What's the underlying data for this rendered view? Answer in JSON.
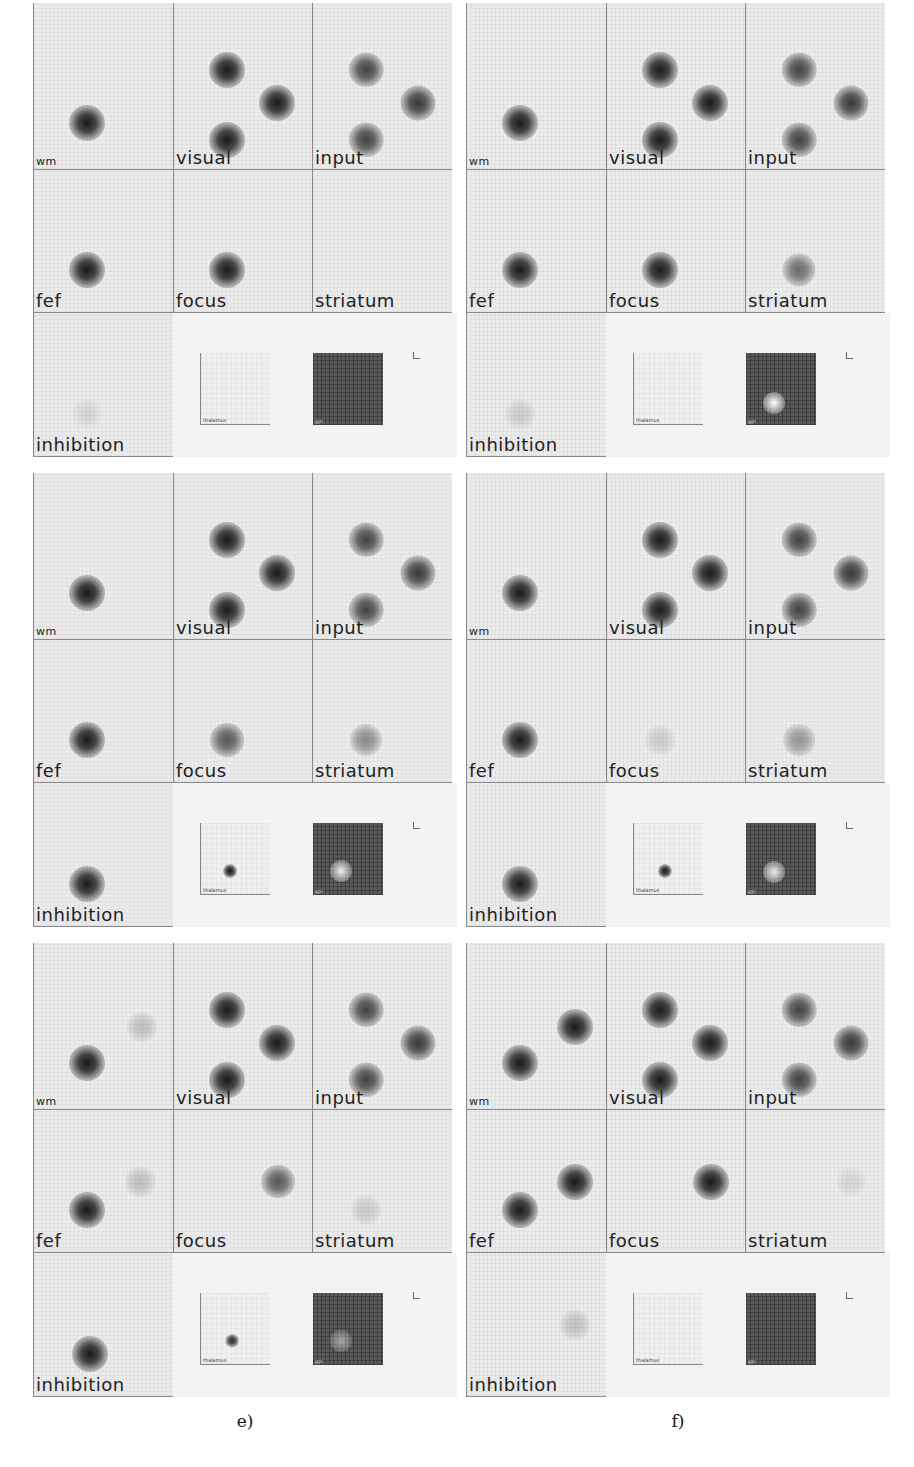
{
  "figure": {
    "panels": [
      {
        "id": "a",
        "caption": "a)",
        "cells": {
          "wm": {
            "label": "wm",
            "blobs": [
              {
                "x": 0.38,
                "y": 0.72,
                "i": 1.0
              }
            ]
          },
          "visual": {
            "label": "visual",
            "blobs": [
              {
                "x": 0.38,
                "y": 0.4,
                "i": 1.0
              },
              {
                "x": 0.74,
                "y": 0.6,
                "i": 1.0
              },
              {
                "x": 0.38,
                "y": 0.82,
                "i": 1.0
              }
            ]
          },
          "input": {
            "label": "input",
            "blobs": [
              {
                "x": 0.38,
                "y": 0.4,
                "i": 0.8
              },
              {
                "x": 0.75,
                "y": 0.6,
                "i": 0.85
              },
              {
                "x": 0.38,
                "y": 0.82,
                "i": 0.8
              }
            ]
          },
          "fef": {
            "label": "fef",
            "blobs": [
              {
                "x": 0.38,
                "y": 0.7,
                "i": 1.0
              }
            ]
          },
          "focus": {
            "label": "focus",
            "blobs": [
              {
                "x": 0.38,
                "y": 0.7,
                "i": 1.0
              }
            ]
          },
          "striatum": {
            "label": "striatum",
            "blobs": []
          },
          "inhibition": {
            "label": "inhibition",
            "blobs": [
              {
                "x": 0.38,
                "y": 0.7,
                "i": 0.1
              }
            ]
          }
        },
        "thalamus": {
          "label": "thalamus",
          "blob": null
        },
        "gpi": {
          "label": "gpi",
          "hole": null
        }
      },
      {
        "id": "b",
        "caption": "b)",
        "cells": {
          "wm": {
            "label": "wm",
            "blobs": [
              {
                "x": 0.38,
                "y": 0.72,
                "i": 1.0
              }
            ]
          },
          "visual": {
            "label": "visual",
            "blobs": [
              {
                "x": 0.38,
                "y": 0.4,
                "i": 1.0
              },
              {
                "x": 0.74,
                "y": 0.6,
                "i": 1.0
              },
              {
                "x": 0.38,
                "y": 0.82,
                "i": 1.0
              }
            ]
          },
          "input": {
            "label": "input",
            "blobs": [
              {
                "x": 0.38,
                "y": 0.4,
                "i": 0.8
              },
              {
                "x": 0.75,
                "y": 0.6,
                "i": 0.85
              },
              {
                "x": 0.38,
                "y": 0.82,
                "i": 0.8
              }
            ]
          },
          "fef": {
            "label": "fef",
            "blobs": [
              {
                "x": 0.38,
                "y": 0.7,
                "i": 1.0
              }
            ]
          },
          "focus": {
            "label": "focus",
            "blobs": [
              {
                "x": 0.38,
                "y": 0.7,
                "i": 1.0
              }
            ]
          },
          "striatum": {
            "label": "striatum",
            "blobs": [
              {
                "x": 0.38,
                "y": 0.7,
                "i": 0.6
              }
            ]
          },
          "inhibition": {
            "label": "inhibition",
            "blobs": [
              {
                "x": 0.38,
                "y": 0.7,
                "i": 0.15
              }
            ]
          }
        },
        "thalamus": {
          "label": "thalamus",
          "blob": null
        },
        "gpi": {
          "label": "gpi",
          "hole": {
            "x": 0.4,
            "y": 0.7,
            "i": 1.0
          }
        }
      },
      {
        "id": "c",
        "caption": "c)",
        "cells": {
          "wm": {
            "label": "wm",
            "blobs": [
              {
                "x": 0.38,
                "y": 0.72,
                "i": 1.0
              }
            ]
          },
          "visual": {
            "label": "visual",
            "blobs": [
              {
                "x": 0.38,
                "y": 0.4,
                "i": 1.0
              },
              {
                "x": 0.74,
                "y": 0.6,
                "i": 1.0
              },
              {
                "x": 0.38,
                "y": 0.82,
                "i": 1.0
              }
            ]
          },
          "input": {
            "label": "input",
            "blobs": [
              {
                "x": 0.38,
                "y": 0.4,
                "i": 0.8
              },
              {
                "x": 0.75,
                "y": 0.6,
                "i": 0.85
              },
              {
                "x": 0.38,
                "y": 0.82,
                "i": 0.8
              }
            ]
          },
          "fef": {
            "label": "fef",
            "blobs": [
              {
                "x": 0.38,
                "y": 0.7,
                "i": 1.0
              }
            ]
          },
          "focus": {
            "label": "focus",
            "blobs": [
              {
                "x": 0.38,
                "y": 0.7,
                "i": 0.7
              }
            ]
          },
          "striatum": {
            "label": "striatum",
            "blobs": [
              {
                "x": 0.38,
                "y": 0.7,
                "i": 0.45
              }
            ]
          },
          "inhibition": {
            "label": "inhibition",
            "blobs": [
              {
                "x": 0.38,
                "y": 0.7,
                "i": 1.0
              }
            ]
          }
        },
        "thalamus": {
          "label": "thalamus",
          "blob": {
            "x": 0.42,
            "y": 0.66,
            "i": 1.0
          }
        },
        "gpi": {
          "label": "gpi",
          "hole": {
            "x": 0.4,
            "y": 0.66,
            "i": 0.9
          }
        }
      },
      {
        "id": "d",
        "caption": "d)",
        "cells": {
          "wm": {
            "label": "wm",
            "blobs": [
              {
                "x": 0.38,
                "y": 0.72,
                "i": 1.0
              }
            ]
          },
          "visual": {
            "label": "visual",
            "blobs": [
              {
                "x": 0.38,
                "y": 0.4,
                "i": 1.0
              },
              {
                "x": 0.74,
                "y": 0.6,
                "i": 1.0
              },
              {
                "x": 0.38,
                "y": 0.82,
                "i": 1.0
              }
            ]
          },
          "input": {
            "label": "input",
            "blobs": [
              {
                "x": 0.38,
                "y": 0.4,
                "i": 0.8
              },
              {
                "x": 0.75,
                "y": 0.6,
                "i": 0.85
              },
              {
                "x": 0.38,
                "y": 0.82,
                "i": 0.8
              }
            ]
          },
          "fef": {
            "label": "fef",
            "blobs": [
              {
                "x": 0.38,
                "y": 0.7,
                "i": 1.0
              }
            ]
          },
          "focus": {
            "label": "focus",
            "blobs": [
              {
                "x": 0.38,
                "y": 0.7,
                "i": 0.15
              }
            ]
          },
          "striatum": {
            "label": "striatum",
            "blobs": [
              {
                "x": 0.38,
                "y": 0.7,
                "i": 0.4
              }
            ]
          },
          "inhibition": {
            "label": "inhibition",
            "blobs": [
              {
                "x": 0.38,
                "y": 0.7,
                "i": 1.0
              }
            ]
          }
        },
        "thalamus": {
          "label": "thalamus",
          "blob": {
            "x": 0.44,
            "y": 0.66,
            "i": 1.0
          }
        },
        "gpi": {
          "label": "gpi",
          "hole": {
            "x": 0.4,
            "y": 0.68,
            "i": 0.9
          }
        }
      },
      {
        "id": "e",
        "caption": "e)",
        "cells": {
          "wm": {
            "label": "wm",
            "blobs": [
              {
                "x": 0.38,
                "y": 0.72,
                "i": 1.0
              },
              {
                "x": 0.77,
                "y": 0.5,
                "i": 0.2
              }
            ]
          },
          "visual": {
            "label": "visual",
            "blobs": [
              {
                "x": 0.38,
                "y": 0.4,
                "i": 1.0
              },
              {
                "x": 0.74,
                "y": 0.6,
                "i": 1.0
              },
              {
                "x": 0.38,
                "y": 0.82,
                "i": 1.0
              }
            ]
          },
          "input": {
            "label": "input",
            "blobs": [
              {
                "x": 0.38,
                "y": 0.4,
                "i": 0.8
              },
              {
                "x": 0.75,
                "y": 0.6,
                "i": 0.85
              },
              {
                "x": 0.38,
                "y": 0.82,
                "i": 0.8
              }
            ]
          },
          "fef": {
            "label": "fef",
            "blobs": [
              {
                "x": 0.38,
                "y": 0.7,
                "i": 1.0
              },
              {
                "x": 0.76,
                "y": 0.5,
                "i": 0.2
              }
            ]
          },
          "focus": {
            "label": "focus",
            "blobs": [
              {
                "x": 0.75,
                "y": 0.5,
                "i": 0.7
              }
            ]
          },
          "striatum": {
            "label": "striatum",
            "blobs": [
              {
                "x": 0.38,
                "y": 0.7,
                "i": 0.15
              }
            ]
          },
          "inhibition": {
            "label": "inhibition",
            "blobs": [
              {
                "x": 0.4,
                "y": 0.7,
                "i": 1.0
              }
            ]
          }
        },
        "thalamus": {
          "label": "thalamus",
          "blob": {
            "x": 0.44,
            "y": 0.66,
            "i": 0.9
          }
        },
        "gpi": {
          "label": "gpi",
          "hole": {
            "x": 0.4,
            "y": 0.66,
            "i": 0.5
          }
        }
      },
      {
        "id": "f",
        "caption": "f)",
        "cells": {
          "wm": {
            "label": "wm",
            "blobs": [
              {
                "x": 0.38,
                "y": 0.72,
                "i": 1.0
              },
              {
                "x": 0.77,
                "y": 0.5,
                "i": 1.0
              }
            ]
          },
          "visual": {
            "label": "visual",
            "blobs": [
              {
                "x": 0.38,
                "y": 0.4,
                "i": 1.0
              },
              {
                "x": 0.74,
                "y": 0.6,
                "i": 1.0
              },
              {
                "x": 0.38,
                "y": 0.82,
                "i": 1.0
              }
            ]
          },
          "input": {
            "label": "input",
            "blobs": [
              {
                "x": 0.38,
                "y": 0.4,
                "i": 0.8
              },
              {
                "x": 0.75,
                "y": 0.6,
                "i": 0.85
              },
              {
                "x": 0.38,
                "y": 0.82,
                "i": 0.8
              }
            ]
          },
          "fef": {
            "label": "fef",
            "blobs": [
              {
                "x": 0.38,
                "y": 0.7,
                "i": 1.0
              },
              {
                "x": 0.77,
                "y": 0.5,
                "i": 1.0
              }
            ]
          },
          "focus": {
            "label": "focus",
            "blobs": [
              {
                "x": 0.75,
                "y": 0.5,
                "i": 1.0
              }
            ]
          },
          "striatum": {
            "label": "striatum",
            "blobs": [
              {
                "x": 0.75,
                "y": 0.5,
                "i": 0.1
              }
            ]
          },
          "inhibition": {
            "label": "inhibition",
            "blobs": [
              {
                "x": 0.77,
                "y": 0.5,
                "i": 0.2
              }
            ]
          }
        },
        "thalamus": {
          "label": "thalamus",
          "blob": null
        },
        "gpi": {
          "label": "gpi",
          "hole": null
        }
      }
    ]
  }
}
